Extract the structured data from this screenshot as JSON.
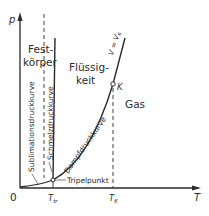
{
  "diagram": {
    "type": "phase-diagram",
    "axes": {
      "y_label": "p",
      "x_label": "T",
      "origin_label": "0",
      "x_ticks": [
        {
          "label": "T",
          "sub": "tr"
        },
        {
          "label": "T",
          "sub": "K"
        }
      ]
    },
    "regions": {
      "solid_line1": "Fest-",
      "solid_line2": "körper",
      "liquid_line1": "Flüssig-",
      "liquid_line2": "keit",
      "gas": "Gas"
    },
    "curves": {
      "sublimation": "Sublimationsdruckkurve",
      "melting": "Schmelzdruckkurve",
      "vapor": "Dampfdruckkurve",
      "isochore": "V = V",
      "isochore_sub": "K"
    },
    "points": {
      "triple_point": "Tripelpunkt",
      "critical_point": "K"
    },
    "colors": {
      "ink": "#2a2a2a",
      "background": "#ffffff"
    }
  }
}
